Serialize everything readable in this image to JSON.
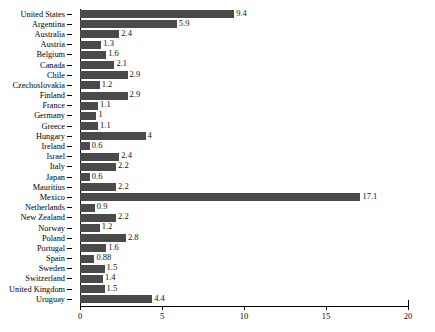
{
  "chart_data": {
    "type": "bar",
    "orientation": "horizontal",
    "title": "",
    "subtitle": "",
    "xlabel": "",
    "ylabel": "",
    "xlim": [
      0,
      20
    ],
    "ylim": null,
    "grid": false,
    "legend": null,
    "bar_color": "#4a4a4a",
    "axis_color": "#000000",
    "background_color": "#ffffff",
    "x_ticks": [
      {
        "value": 0,
        "label": "0"
      },
      {
        "value": 5,
        "label": "5"
      },
      {
        "value": 10,
        "label": "10"
      },
      {
        "value": 15,
        "label": "15"
      },
      {
        "value": 20,
        "label": "20"
      }
    ],
    "categories": [
      "United States",
      "Argentina",
      "Australia",
      "Austria",
      "Belgium",
      "Canada",
      "Chile",
      "Czechoslovakia",
      "Finland",
      "France",
      "Germany",
      "Greece",
      "Hungary",
      "Ireland",
      "Israel",
      "Italy",
      "Japan",
      "Mauritius",
      "Mexico",
      "Netherlands",
      "New Zealand",
      "Norway",
      "Poland",
      "Portugal",
      "Spain",
      "Sweden",
      "Switzerland",
      "United Kingdom",
      "Uruguay"
    ],
    "values": [
      9.4,
      5.9,
      2.4,
      1.3,
      1.6,
      2.1,
      2.9,
      1.2,
      2.9,
      1.1,
      1,
      1.1,
      4,
      0.6,
      2.4,
      2.2,
      0.6,
      2.2,
      17.1,
      0.9,
      2.2,
      1.2,
      2.8,
      1.6,
      0.88,
      1.5,
      1.4,
      1.5,
      4.4
    ],
    "value_labels": [
      "9.4",
      "5.9",
      "2.4",
      "1.3",
      "1.6",
      "2.1",
      "2.9",
      "1.2",
      "2.9",
      "1.1",
      "1",
      "1.1",
      "4",
      "0.6",
      "2.4",
      "2.2",
      "0.6",
      "2.2",
      "17.1",
      "0.9",
      "2.2",
      "1.2",
      "2.8",
      "1.6",
      "0.88",
      "1.5",
      "1.4",
      "1.5",
      "4.4"
    ]
  }
}
